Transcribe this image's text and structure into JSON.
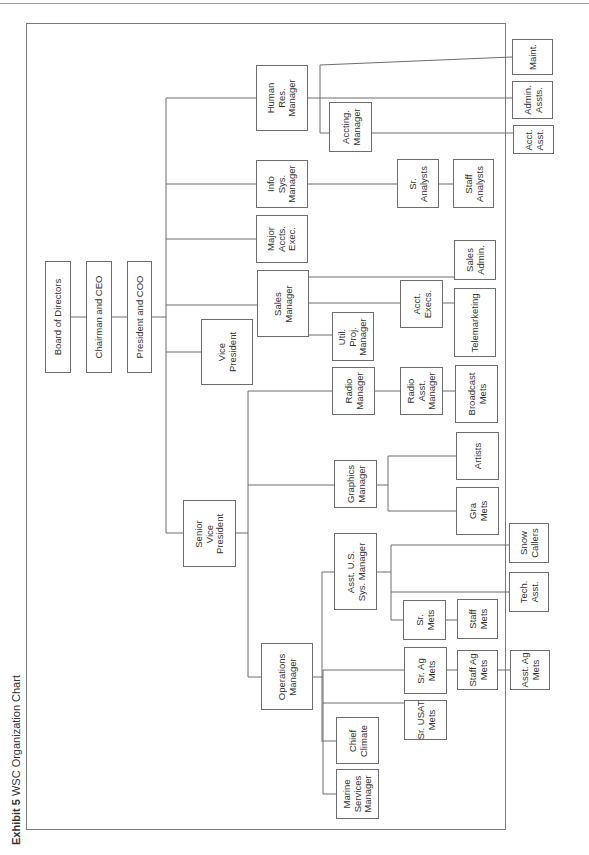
{
  "caption": {
    "label": "Exhibit 5",
    "title": "WSC Organization Chart"
  },
  "nodes": {
    "board": "Board of Directors",
    "ceo": "Chairman and CEO",
    "president": "President and COO",
    "vp": "Vice\nPresident",
    "svp": "Senior\nVice\nPresident",
    "hr": "Human\nRes.\nManager",
    "accting": "Accting.\nManager",
    "maint": "Maint.",
    "admin_assts": "Admin.\nAssts.",
    "acct_asst": "Acct.\nAsst.",
    "info_sys": "Info\nSys.\nManager",
    "sr_analysts": "Sr.\nAnalysts",
    "staff_analysts": "Staff\nAnalysts",
    "major_accts": "Major\nAccts.\nExec.",
    "sales_mgr": "Sales\nManager",
    "util_proj": "Util.\nProj.\nManager",
    "acct_execs": "Acct.\nExecs.",
    "sales_admin": "Sales\nAdmin.",
    "telemarketing": "Telemarketing",
    "radio_mgr": "Radio\nManager",
    "radio_asst": "Radio\nAsst.\nManager",
    "broadcast_mets": "Broadcast\nMets",
    "graphics_mgr": "Graphics\nManager",
    "artists": "Artists",
    "gra_mets": "Gra\nMets",
    "asst_us_sys": "Asst. U.S.\nSys. Manager",
    "snow_callers": "Snow\nCallers",
    "tech_asst": "Tech.\nAsst.",
    "sr_mets": "Sr.\nMets",
    "staff_mets": "Staff\nMets",
    "ops_mgr": "Operations\nManager",
    "sr_ag_mets": "Sr. Ag\nMets",
    "staff_ag_mets": "Staff Ag\nMets",
    "asst_ag_mets": "Asst. Ag\nMets",
    "sr_usat_mets": "Sr. USAT\nMets",
    "chief_climate": "Chief\nClimate",
    "marine_services": "Marine\nServices\nManager"
  },
  "colors": {
    "line": "#6d6d6d",
    "text": "#333333",
    "background": "#ffffff"
  }
}
